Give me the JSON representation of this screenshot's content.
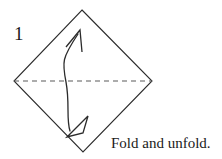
{
  "figure": {
    "step_number": "1",
    "caption": "Fold and unfold.",
    "colors": {
      "background": "#ffffff",
      "outline": "#2b2b2b",
      "crease_line": "#5a5a5a",
      "arrow": "#2b2b2b",
      "text": "#1a1a1a"
    },
    "shape": {
      "name": "square-rotated-diamond",
      "vertices": {
        "top": [
          82,
          10
        ],
        "right": [
          152,
          81
        ],
        "bottom": [
          83,
          152
        ],
        "left": [
          14,
          81
        ]
      }
    },
    "crease": {
      "name": "horizontal-valley-crease",
      "style": "dashed",
      "from": [
        14,
        81
      ],
      "to": [
        152,
        81
      ],
      "dash": "5 4"
    },
    "arrows": [
      {
        "name": "fold-arrow-down",
        "head_style": "hollow-triangle",
        "direction": "down",
        "tip": [
          67,
          137
        ]
      },
      {
        "name": "unfold-arrow-up",
        "head_style": "open-v",
        "direction": "up",
        "tip": [
          80,
          30
        ]
      }
    ]
  }
}
